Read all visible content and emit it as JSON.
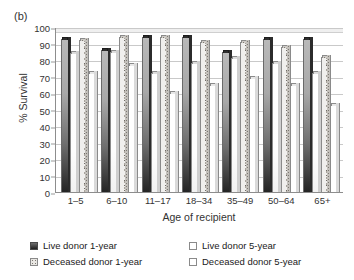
{
  "panel": {
    "label": "(b)"
  },
  "chart_data": {
    "type": "bar",
    "title": "",
    "xlabel": "Age of recipient",
    "ylabel": "% Survival",
    "ylim": [
      0,
      100
    ],
    "ytick_step": 10,
    "yticks": [
      100,
      90,
      80,
      70,
      60,
      50,
      40,
      30,
      20,
      10,
      0
    ],
    "grid": true,
    "legend_position": "bottom",
    "categories": [
      "1–5",
      "6–10",
      "11–17",
      "18–34",
      "35–49",
      "50–64",
      "65+"
    ],
    "series": [
      {
        "name": "Live donor 1-year",
        "key": "s1",
        "values": [
          93,
          86,
          94,
          94,
          85,
          93,
          93
        ]
      },
      {
        "name": "Live donor 5-year",
        "key": "s2",
        "values": [
          84,
          85,
          72,
          78,
          81,
          78,
          72
        ]
      },
      {
        "name": "Deceased donor 1-year",
        "key": "s3",
        "values": [
          92,
          94,
          94,
          91,
          91,
          88,
          82
        ]
      },
      {
        "name": "Deceased donor 5-year",
        "key": "s4",
        "values": [
          72,
          77,
          60,
          65,
          69,
          65,
          53
        ]
      }
    ]
  },
  "legend": {
    "items": [
      {
        "label": "Live donor 1-year",
        "key": "s1"
      },
      {
        "label": "Live donor 5-year",
        "key": "s2"
      },
      {
        "label": "Deceased donor 1-year",
        "key": "s3"
      },
      {
        "label": "Deceased donor 5-year",
        "key": "s4"
      }
    ]
  }
}
